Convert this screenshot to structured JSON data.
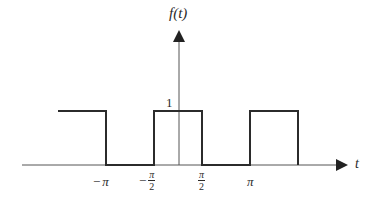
{
  "diagram": {
    "type": "periodic square wave",
    "y_axis_label": "f(t)",
    "x_axis_label": "t",
    "amplitude_label": "1",
    "x_ticks": [
      {
        "id": "neg-pi",
        "sign": "−",
        "symbol": "π",
        "denominator": null
      },
      {
        "id": "neg-pi-half",
        "sign": "−",
        "symbol": "π",
        "denominator": "2"
      },
      {
        "id": "pi-half",
        "sign": "",
        "symbol": "π",
        "denominator": "2"
      },
      {
        "id": "pi",
        "sign": "",
        "symbol": "π",
        "denominator": null
      }
    ],
    "colors": {
      "signal": "#2b2b2b",
      "axis": "#555555",
      "text": "#2a2a2a"
    },
    "segments": [
      {
        "from_t": "-3π/2",
        "to_t": "-π",
        "value": 1
      },
      {
        "from_t": "-π",
        "to_t": "-π/2",
        "value": 0
      },
      {
        "from_t": "-π/2",
        "to_t": "π/2",
        "value": 1
      },
      {
        "from_t": "π/2",
        "to_t": "π",
        "value": 0
      },
      {
        "from_t": "π",
        "to_t": "3π/2",
        "value": 1
      }
    ]
  }
}
